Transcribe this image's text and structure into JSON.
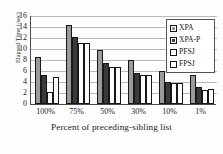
{
  "chart_data": {
    "type": "bar",
    "title": "",
    "xlabel": "Percent of preceding-sibling list",
    "ylabel": "Elapsed Time (/sec)",
    "categories": [
      "100%",
      "75%",
      "50%",
      "30%",
      "10%",
      "1%"
    ],
    "yticks": [
      16,
      14,
      12,
      10,
      8,
      6,
      4,
      2,
      0
    ],
    "ylim": [
      0,
      16
    ],
    "grid": "horizontal",
    "legend_position": "top-right",
    "series": [
      {
        "name": "XPA",
        "color": "#9b9b9b",
        "values": [
          8.6,
          14.35,
          9.75,
          8.05,
          6.0,
          5.2
        ]
      },
      {
        "name": "XPA-P",
        "color": "#3a3a3a",
        "values": [
          5.3,
          12.2,
          7.4,
          5.55,
          3.95,
          3.1
        ]
      },
      {
        "name": "PFSJ",
        "color": "#ffffff",
        "values": [
          2.2,
          11.1,
          6.8,
          5.2,
          3.75,
          2.55
        ]
      },
      {
        "name": "FPSJ",
        "color": "#fdfdfd",
        "values": [
          5.0,
          11.1,
          6.8,
          5.2,
          3.75,
          2.7
        ]
      }
    ]
  }
}
